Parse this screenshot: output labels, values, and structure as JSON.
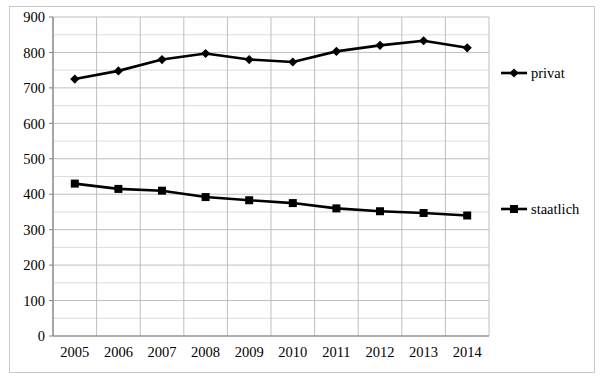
{
  "chart_data": {
    "type": "line",
    "title": "",
    "subtitle": "",
    "xlabel": "",
    "ylabel": "",
    "categories": [
      "2005",
      "2006",
      "2007",
      "2008",
      "2009",
      "2010",
      "2011",
      "2012",
      "2013",
      "2014"
    ],
    "series": [
      {
        "name": "privat",
        "marker": "diamond",
        "color": "#000000",
        "values": [
          725,
          748,
          780,
          797,
          780,
          773,
          803,
          820,
          833,
          813
        ]
      },
      {
        "name": "staatlich",
        "marker": "square",
        "color": "#000000",
        "values": [
          430,
          415,
          410,
          392,
          383,
          375,
          360,
          352,
          347,
          340
        ]
      }
    ],
    "ylim": [
      0,
      900
    ],
    "ytick_step": 100,
    "yticks": [
      "0",
      "100",
      "200",
      "300",
      "400",
      "500",
      "600",
      "700",
      "800",
      "900"
    ],
    "minor_gridline_step": 50,
    "grid": true,
    "grid_color": "#b3b3b3",
    "axis_color": "#7f7f7f",
    "legend_position": "right",
    "legend": [
      {
        "label": "privat",
        "marker": "diamond"
      },
      {
        "label": "staatlich",
        "marker": "square"
      }
    ],
    "border_color": "#c9c9c9",
    "background": "#ffffff"
  }
}
